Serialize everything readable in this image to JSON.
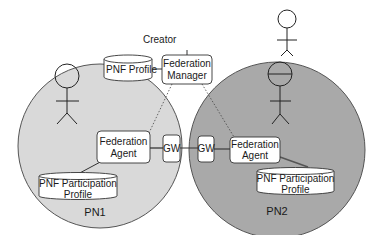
{
  "diagram": {
    "creator": {
      "label": "Creator"
    },
    "pnf_profile": {
      "label": "PNF Profile"
    },
    "federation_manager": {
      "line1": "Federation",
      "line2": "Manager"
    },
    "networks": [
      {
        "name": "PN1",
        "fill": "#d9d9d9",
        "agent": {
          "line1": "Federation",
          "line2": "Agent"
        },
        "gateway": "GW",
        "profile": {
          "line1": "PNF Participation",
          "line2": "Profile"
        }
      },
      {
        "name": "PN2",
        "fill": "#a9a9a9",
        "agent": {
          "line1": "Federation",
          "line2": "Agent"
        },
        "gateway": "GW",
        "profile": {
          "line1": "PNF Participation",
          "line2": "Profile"
        }
      }
    ]
  }
}
